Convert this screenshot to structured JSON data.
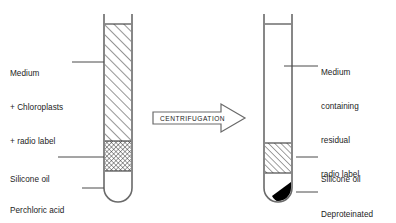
{
  "figure": {
    "type": "diagram",
    "caption": ""
  },
  "process": {
    "arrow_label": "CENTRIFUGATION",
    "direction": "left-to-right"
  },
  "tubes": [
    {
      "id": "before",
      "position": "left",
      "contents": [
        {
          "id": "medium",
          "fill": "diagonal-hatch",
          "color": "#000000"
        },
        {
          "id": "silicone-oil",
          "fill": "cross-hatch",
          "color": "#000000"
        },
        {
          "id": "perchloric-acid",
          "fill": "none",
          "color": "#ffffff"
        }
      ],
      "labels": [
        {
          "id": "medium-label",
          "lines": [
            "Medium",
            "+ Chloroplasts",
            "+ radio label"
          ]
        },
        {
          "id": "silicone-oil-label",
          "lines": [
            "Silicone oil"
          ]
        },
        {
          "id": "perchloric-label",
          "lines": [
            "Perchloric acid",
            "in sucrose"
          ]
        }
      ]
    },
    {
      "id": "after",
      "position": "right",
      "contents": [
        {
          "id": "medium-residual",
          "fill": "none",
          "color": "#ffffff"
        },
        {
          "id": "silicone-oil",
          "fill": "diagonal-hatch",
          "color": "#000000"
        },
        {
          "id": "pellet",
          "fill": "solid",
          "color": "#000000"
        }
      ],
      "labels": [
        {
          "id": "medium-residual-label",
          "lines": [
            "Medium",
            "containing",
            "residual",
            "radio label"
          ]
        },
        {
          "id": "silicone-oil-label",
          "lines": [
            "Silicone oil"
          ]
        },
        {
          "id": "pellet-label",
          "lines": [
            "Deproteinated",
            "chloroplasts"
          ]
        }
      ]
    }
  ],
  "text": {
    "left_medium_line1": "Medium",
    "left_medium_line2": "+ Chloroplasts",
    "left_medium_line3": "+ radio label",
    "left_silicone": "Silicone oil",
    "left_perchloric_line1": "Perchloric acid",
    "left_perchloric_line2": "in sucrose",
    "right_medium_line1": "Medium",
    "right_medium_line2": "containing",
    "right_medium_line3": "residual",
    "right_medium_line4": "radio label",
    "right_silicone": "Silicone oil",
    "right_pellet_line1": "Deproteinated",
    "right_pellet_line2": "chloroplasts",
    "arrow": "CENTRIFUGATION"
  },
  "colors": {
    "stroke": "#4a4a4a",
    "hatch": "#2b2b2b",
    "pellet": "#000000",
    "text": "#1c1c1c",
    "background": "#ffffff"
  }
}
